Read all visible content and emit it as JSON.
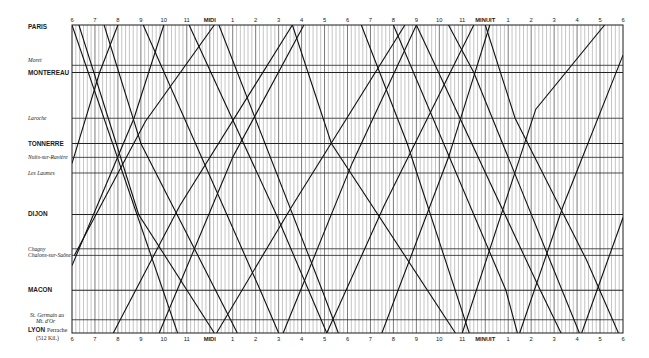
{
  "chart_data": {
    "type": "line",
    "xlabel": "Hour of day (6 a.m. to 6 a.m. next day)",
    "ylabel": "Station (distance along line)",
    "x_ticks": [
      "6",
      "7",
      "8",
      "9",
      "10",
      "11",
      "MIDI",
      "1",
      "2",
      "3",
      "4",
      "5",
      "6",
      "7",
      "8",
      "9",
      "10",
      "11",
      "MINUIT",
      "1",
      "2",
      "3",
      "4",
      "5",
      "6"
    ],
    "x_range_hours": [
      6,
      30
    ],
    "minor_grid_minutes": 10,
    "grid": true,
    "stations": [
      {
        "name": "PARIS",
        "style": "major",
        "km": 0
      },
      {
        "name": "Moret",
        "style": "minor",
        "km": 67
      },
      {
        "name": "MONTEREAU",
        "style": "major",
        "km": 79
      },
      {
        "name": "Laroche",
        "style": "minor",
        "km": 155
      },
      {
        "name": "TONNERRE",
        "style": "major",
        "km": 197
      },
      {
        "name": "Nuits-sur-Ravière",
        "style": "minor",
        "km": 220
      },
      {
        "name": "Les Laumes",
        "style": "minor",
        "km": 246
      },
      {
        "name": "DIJON",
        "style": "major",
        "km": 315
      },
      {
        "name": "Chagny",
        "style": "minor",
        "km": 372
      },
      {
        "name": "Chalons-sur-Saône",
        "style": "minor",
        "km": 383
      },
      {
        "name": "MACON",
        "style": "major",
        "km": 441
      },
      {
        "name": "St. Germain au Mt. d'Or",
        "style": "minor",
        "km": 490
      },
      {
        "name": "LYON Perrache",
        "style": "major",
        "km": 512
      }
    ],
    "end_note": "(512 Kil.)",
    "series": [
      {
        "name": "down-1",
        "direction": "Paris→Lyon",
        "points": [
          [
            6.0,
            0
          ],
          [
            10.6,
            512
          ]
        ]
      },
      {
        "name": "down-2",
        "direction": "Paris→Lyon",
        "points": [
          [
            6.3,
            0
          ],
          [
            8.9,
            315
          ],
          [
            12.2,
            512
          ]
        ]
      },
      {
        "name": "down-3",
        "direction": "Paris→Lyon",
        "points": [
          [
            7.4,
            0
          ],
          [
            9.0,
            197
          ],
          [
            13.2,
            512
          ]
        ]
      },
      {
        "name": "down-4",
        "direction": "Paris→Lyon",
        "points": [
          [
            9.1,
            0
          ],
          [
            14.2,
            441
          ],
          [
            15.0,
            512
          ]
        ]
      },
      {
        "name": "down-5",
        "direction": "Paris→Lyon",
        "points": [
          [
            11.1,
            0
          ],
          [
            14.9,
            315
          ],
          [
            17.1,
            512
          ]
        ]
      },
      {
        "name": "down-6",
        "direction": "Paris→Lyon",
        "points": [
          [
            12.4,
            0
          ],
          [
            16.9,
            441
          ],
          [
            17.6,
            512
          ]
        ]
      },
      {
        "name": "down-7",
        "direction": "Paris→Lyon",
        "points": [
          [
            15.6,
            0
          ],
          [
            17.3,
            197
          ],
          [
            22.7,
            512
          ]
        ]
      },
      {
        "name": "down-8",
        "direction": "Paris→Lyon",
        "points": [
          [
            18.6,
            0
          ],
          [
            20.6,
            197
          ],
          [
            23.3,
            512
          ]
        ]
      },
      {
        "name": "down-9",
        "direction": "Paris→Lyon",
        "points": [
          [
            20.0,
            0
          ],
          [
            24.9,
            441
          ],
          [
            25.4,
            512
          ]
        ]
      },
      {
        "name": "down-10",
        "direction": "Paris→Lyon",
        "points": [
          [
            21.0,
            0
          ],
          [
            26.4,
            441
          ],
          [
            27.3,
            512
          ]
        ]
      },
      {
        "name": "down-11",
        "direction": "Paris→Lyon",
        "points": [
          [
            22.4,
            0
          ],
          [
            23.5,
            79
          ],
          [
            28.1,
            512
          ]
        ]
      },
      {
        "name": "down-12",
        "direction": "Paris→Lyon",
        "points": [
          [
            24.0,
            0
          ],
          [
            25.3,
            155
          ],
          [
            28.4,
            390
          ],
          [
            29.8,
            512
          ]
        ]
      },
      {
        "name": "up-1",
        "direction": "Lyon→Paris",
        "points": [
          [
            6.0,
            230
          ],
          [
            7.2,
            79
          ],
          [
            8.0,
            0
          ]
        ]
      },
      {
        "name": "up-2",
        "direction": "Lyon→Paris",
        "points": [
          [
            6.0,
            400
          ],
          [
            8.7,
            155
          ],
          [
            10.0,
            0
          ]
        ]
      },
      {
        "name": "up-3",
        "direction": "Lyon→Paris",
        "points": [
          [
            6.1,
            383
          ],
          [
            9.2,
            160
          ],
          [
            12.2,
            0
          ]
        ]
      },
      {
        "name": "up-4",
        "direction": "Lyon→Paris",
        "points": [
          [
            7.8,
            512
          ],
          [
            10.7,
            300
          ],
          [
            15.6,
            0
          ]
        ]
      },
      {
        "name": "up-5",
        "direction": "Lyon→Paris",
        "points": [
          [
            9.8,
            512
          ],
          [
            13.0,
            220
          ],
          [
            16.1,
            0
          ]
        ]
      },
      {
        "name": "up-6",
        "direction": "Lyon→Paris",
        "points": [
          [
            12.3,
            512
          ],
          [
            15.6,
            300
          ],
          [
            20.5,
            0
          ]
        ]
      },
      {
        "name": "up-7",
        "direction": "Lyon→Paris",
        "points": [
          [
            15.2,
            512
          ],
          [
            18.2,
            230
          ],
          [
            21.0,
            0
          ]
        ]
      },
      {
        "name": "up-8",
        "direction": "Lyon→Paris",
        "points": [
          [
            17.1,
            512
          ],
          [
            19.6,
            300
          ],
          [
            23.5,
            0
          ]
        ]
      },
      {
        "name": "up-9",
        "direction": "Lyon→Paris",
        "points": [
          [
            19.5,
            512
          ],
          [
            22.4,
            220
          ],
          [
            24.2,
            0
          ]
        ]
      },
      {
        "name": "up-10",
        "direction": "Lyon→Paris",
        "points": [
          [
            23.0,
            512
          ],
          [
            26.2,
            140
          ],
          [
            29.2,
            0
          ]
        ]
      },
      {
        "name": "up-11",
        "direction": "Lyon→Paris",
        "points": [
          [
            25.5,
            512
          ],
          [
            27.4,
            300
          ],
          [
            30.0,
            50
          ]
        ]
      },
      {
        "name": "up-12",
        "direction": "Lyon→Paris",
        "points": [
          [
            28.2,
            512
          ],
          [
            30.0,
            320
          ]
        ]
      }
    ]
  },
  "labels": {
    "top_axis": "hours",
    "bottom_axis": "hours"
  }
}
